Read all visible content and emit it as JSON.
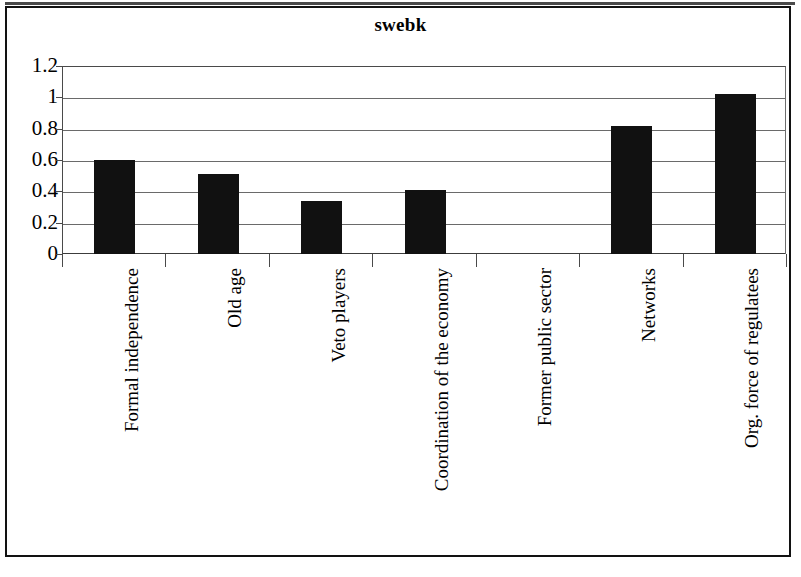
{
  "chart_data": {
    "type": "bar",
    "title": "swebk",
    "xlabel": "",
    "ylabel": "",
    "categories": [
      "Formal independence",
      "Old age",
      "Veto players",
      "Coordination of the economy",
      "Former public sector",
      "Networks",
      "Org. force of regulatees"
    ],
    "values": [
      0.6,
      0.51,
      0.34,
      0.41,
      0,
      0.82,
      1.02
    ],
    "ylim": [
      0,
      1.2
    ],
    "ytick_labels": [
      "0",
      "0.2",
      "0.4",
      "0.6",
      "0.8",
      "1",
      "1.2"
    ],
    "ytick_values": [
      0,
      0.2,
      0.4,
      0.6,
      0.8,
      1,
      1.2
    ],
    "grid": true,
    "legend": false,
    "bar_color": "#111111",
    "orientation": "vertical",
    "xtick_label_rotation": -90
  },
  "figure": {
    "title": "swebk",
    "border_color": "#121212",
    "background": "#ffffff",
    "axis_color": "#4a4a4a",
    "gridline_color": "#6a6a6a"
  }
}
